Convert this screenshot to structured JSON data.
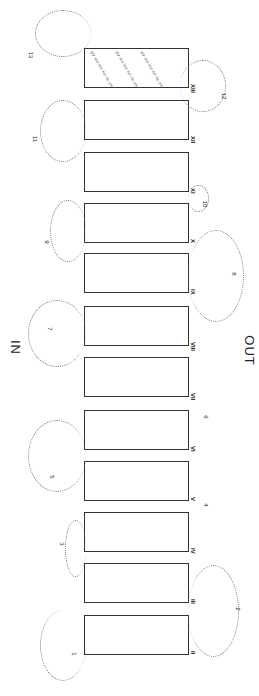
{
  "diagram": {
    "type": "membrane-topology",
    "orientation": "rotated-90",
    "sides": {
      "inside": "IN",
      "outside": "OUT"
    },
    "helices": [
      {
        "label": "XIII",
        "top": 48
      },
      {
        "label": "XII",
        "top": 100
      },
      {
        "label": "XI",
        "top": 152
      },
      {
        "label": "X",
        "top": 203
      },
      {
        "label": "IX",
        "top": 253
      },
      {
        "label": "VIII",
        "top": 306
      },
      {
        "label": "VII",
        "top": 357
      },
      {
        "label": "VI",
        "top": 410
      },
      {
        "label": "V",
        "top": 461
      },
      {
        "label": "IV",
        "top": 512
      },
      {
        "label": "III",
        "top": 563
      },
      {
        "label": "II",
        "top": 615
      },
      {
        "label": "I",
        "top": 655
      }
    ],
    "loops": [
      {
        "label": "1",
        "side": "IN"
      },
      {
        "label": "2",
        "side": "OUT"
      },
      {
        "label": "3",
        "side": "IN"
      },
      {
        "label": "4",
        "side": "OUT"
      },
      {
        "label": "5",
        "side": "IN"
      },
      {
        "label": "6",
        "side": "OUT"
      },
      {
        "label": "7",
        "side": "IN"
      },
      {
        "label": "8",
        "side": "OUT"
      },
      {
        "label": "9",
        "side": "IN"
      },
      {
        "label": "10",
        "side": "OUT"
      },
      {
        "label": "11",
        "side": "IN"
      },
      {
        "label": "12",
        "side": "OUT"
      },
      {
        "label": "13",
        "side": "IN"
      }
    ],
    "residue_text": "gly·ala·leu·val·ile·phe·ser·thr·asn·gln"
  }
}
